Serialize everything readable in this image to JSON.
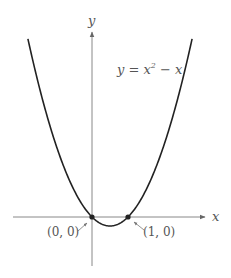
{
  "figure": {
    "equation_label": "y = x² − x",
    "equation_parts": {
      "lhs": "y = x",
      "exp": "2",
      "rhs": " − x"
    },
    "x_axis_label": "x",
    "y_axis_label": "y",
    "points": [
      {
        "label": "(0, 0)",
        "x": 0,
        "y": 0
      },
      {
        "label": "(1, 0)",
        "x": 1,
        "y": 0
      }
    ]
  },
  "chart_data": {
    "type": "line",
    "xlabel": "x",
    "ylabel": "y",
    "series": [
      {
        "name": "y = x^2 - x",
        "x": [
          -1.8,
          -1.5,
          -1,
          -0.5,
          0,
          0.5,
          1,
          1.5,
          2,
          2.5,
          2.8
        ],
        "values": [
          5.04,
          3.75,
          2,
          0.75,
          0,
          -0.25,
          0,
          0.75,
          2,
          3.75,
          5.04
        ]
      }
    ],
    "annotations": [
      {
        "text": "(0, 0)",
        "x": 0,
        "y": 0
      },
      {
        "text": "(1, 0)",
        "x": 1,
        "y": 0
      }
    ],
    "grid": false,
    "legend": "none"
  },
  "colors": {
    "curve": "#222222",
    "axis": "#777777",
    "text": "#555555",
    "point": "#222222"
  }
}
